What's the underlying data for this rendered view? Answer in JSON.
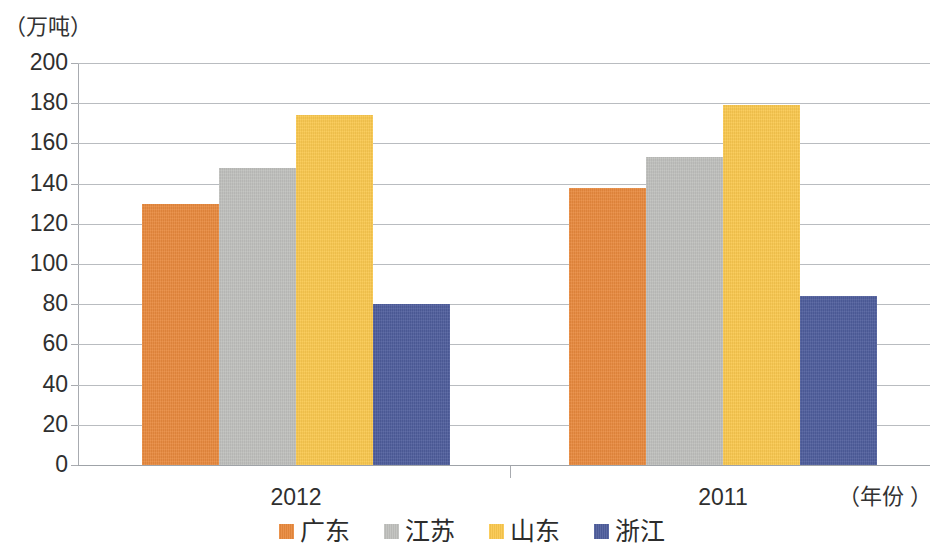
{
  "chart_data": {
    "type": "bar",
    "title": "",
    "subtitle": "",
    "xlabel": "（年份 ）",
    "ylabel": "（万吨）",
    "ylim": [
      0,
      200
    ],
    "ytick_step": 20,
    "yticks": [
      "200",
      "180",
      "160",
      "140",
      "120",
      "100",
      "80",
      "60",
      "40",
      "20",
      "0"
    ],
    "ytick_values": [
      200,
      180,
      160,
      140,
      120,
      100,
      80,
      60,
      40,
      20,
      0
    ],
    "categories": [
      "2012",
      "2011"
    ],
    "grid": true,
    "legend_position": "bottom",
    "series": [
      {
        "name": "广东",
        "color": "#e8893d",
        "values": [
          130,
          138
        ]
      },
      {
        "name": "江苏",
        "color": "#bfc0bd",
        "values": [
          148,
          153
        ]
      },
      {
        "name": "山东",
        "color": "#fac84e",
        "values": [
          174,
          179
        ]
      },
      {
        "name": "浙江",
        "color": "#4e5d9c",
        "values": [
          80,
          84
        ]
      }
    ]
  }
}
